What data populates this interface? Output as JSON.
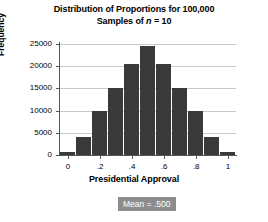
{
  "title": {
    "line1": "Distribution of Proportions for 100,000",
    "line2_prefix": "Samples of ",
    "line2_n": "n",
    "line2_suffix": " = 10"
  },
  "annotation": {
    "mean_label": "Mean = .500"
  },
  "colors": {
    "bar": "#3a3a3a",
    "grid": "#c9c9c9",
    "axis": "#555555",
    "mean_box_bg": "#8d8d8d",
    "mean_box_text": "#ffffff",
    "background": "#ffffff"
  },
  "chart_data": {
    "type": "bar",
    "title": "Distribution of Proportions for 100,000 Samples of n = 10",
    "xlabel": "Presidential Approval",
    "ylabel": "Frequency",
    "xlim": [
      -0.05,
      1.05
    ],
    "ylim": [
      0,
      25000
    ],
    "grid": true,
    "legend": null,
    "x_tick_labels": [
      "0",
      ".2",
      ".4",
      ".6",
      ".8",
      "1"
    ],
    "x_tick_values": [
      0,
      0.2,
      0.4,
      0.6,
      0.8,
      1
    ],
    "y_tick_labels": [
      "0",
      "5000",
      "10000",
      "15000",
      "20000",
      "25000"
    ],
    "y_tick_values": [
      0,
      5000,
      10000,
      15000,
      20000,
      25000
    ],
    "bar_width": 0.1,
    "categories": [
      0,
      0.1,
      0.2,
      0.3,
      0.4,
      0.5,
      0.6,
      0.7,
      0.8,
      0.9,
      1
    ],
    "values": [
      700,
      4000,
      10000,
      15000,
      20500,
      24600,
      20500,
      15000,
      10000,
      4000,
      700
    ]
  }
}
